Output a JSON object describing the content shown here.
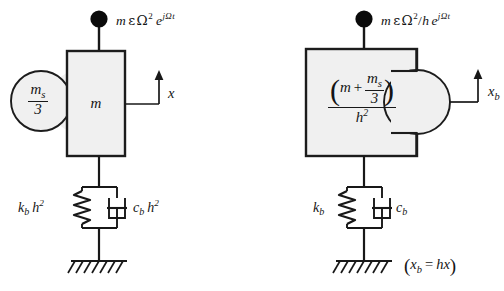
{
  "figure": {
    "type": "mechanical-schematic",
    "panels": [
      {
        "id": "left",
        "name": "original-coordinate-model",
        "force": {
          "mass": "m",
          "eps": "ε",
          "omega": "Ω",
          "omega_power": "2",
          "exp_base": "e",
          "exp_arg": "jΩt",
          "text": "m ε Ω² e^(jΩt)"
        },
        "lobe": {
          "numerator": "m",
          "numerator_sub": "s",
          "denominator": "3",
          "text": "m_s/3"
        },
        "block": {
          "label": "m"
        },
        "coordinate": {
          "label": "x",
          "sub": ""
        },
        "spring": {
          "symbol": "k",
          "sub": "b",
          "factor": "h",
          "factor_power": "2",
          "text": "k_b h²"
        },
        "damper": {
          "symbol": "c",
          "sub": "b",
          "factor": "h",
          "factor_power": "2",
          "text": "c_b h²"
        },
        "ground": "fixed-hatched-ground",
        "note": ""
      },
      {
        "id": "right",
        "name": "transformed-coordinate-model",
        "force": {
          "mass": "m",
          "eps": "ε",
          "omega": "Ω",
          "omega_power": "2",
          "divisor": "h",
          "exp_base": "e",
          "exp_arg": "jΩt",
          "text": "m ε Ω²/h e^(jΩt)"
        },
        "block": {
          "expr_open": "(",
          "expr_mass": "m",
          "expr_plus": "+",
          "expr_num": "m",
          "expr_num_sub": "s",
          "expr_den": "3",
          "expr_close": ")",
          "outer_den": "h",
          "outer_den_power": "2",
          "text": "(m + m_s/3) / h²"
        },
        "coordinate": {
          "label": "x",
          "sub": "b"
        },
        "spring": {
          "symbol": "k",
          "sub": "b",
          "factor": "",
          "factor_power": "",
          "text": "k_b"
        },
        "damper": {
          "symbol": "c",
          "sub": "b",
          "factor": "",
          "factor_power": "",
          "text": "c_b"
        },
        "ground": "fixed-hatched-ground",
        "note": {
          "open": "(",
          "lhs": "x",
          "lhs_sub": "b",
          "eq": "=",
          "rhs": "hx",
          "close": ")",
          "text": "(x_b = hx)"
        }
      }
    ]
  },
  "colors": {
    "stroke": "#181818",
    "block_fill": "#f0f0f0",
    "block_stroke": "#1c1c1c",
    "node_fill": "#0a0a0a",
    "text": "#141414",
    "background": "#ffffff"
  }
}
